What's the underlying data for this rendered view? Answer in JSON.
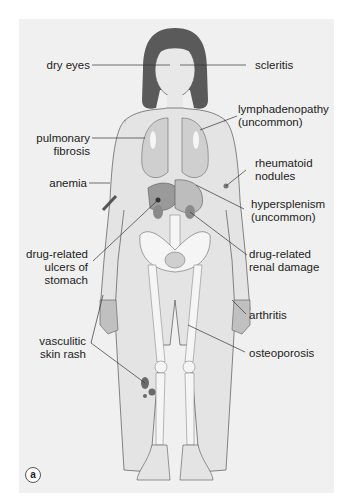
{
  "figure": {
    "panel_label": "a",
    "colors": {
      "background": "#f0f0f0",
      "hair": "#5a5a5a",
      "skin_outline": "#555555",
      "organ_fill": "#c8c8c8",
      "bone_fill": "#f5f5f5",
      "rash": "#707070"
    }
  },
  "labels_left": [
    {
      "id": "dry-eyes",
      "lines": [
        "dry eyes"
      ]
    },
    {
      "id": "pulmonary-fibrosis",
      "lines": [
        "pulmonary",
        "fibrosis"
      ]
    },
    {
      "id": "anemia",
      "lines": [
        "anemia"
      ]
    },
    {
      "id": "drug-related-ulcers",
      "lines": [
        "drug-related",
        "ulcers of",
        "stomach"
      ]
    },
    {
      "id": "vasculitic-skin-rash",
      "lines": [
        "vasculitic",
        "skin rash"
      ]
    }
  ],
  "labels_right": [
    {
      "id": "scleritis",
      "lines": [
        "scleritis"
      ]
    },
    {
      "id": "lymphadenopathy",
      "lines": [
        "lymphadenopathy",
        "(uncommon)"
      ]
    },
    {
      "id": "rheumatoid-nodules",
      "lines": [
        "rheumatoid",
        "nodules"
      ]
    },
    {
      "id": "hypersplenism",
      "lines": [
        "hypersplenism",
        "(uncommon)"
      ]
    },
    {
      "id": "drug-related-renal-damage",
      "lines": [
        "drug-related",
        "renal damage"
      ]
    },
    {
      "id": "arthritis",
      "lines": [
        "arthritis"
      ]
    },
    {
      "id": "osteoporosis",
      "lines": [
        "osteoporosis"
      ]
    }
  ]
}
